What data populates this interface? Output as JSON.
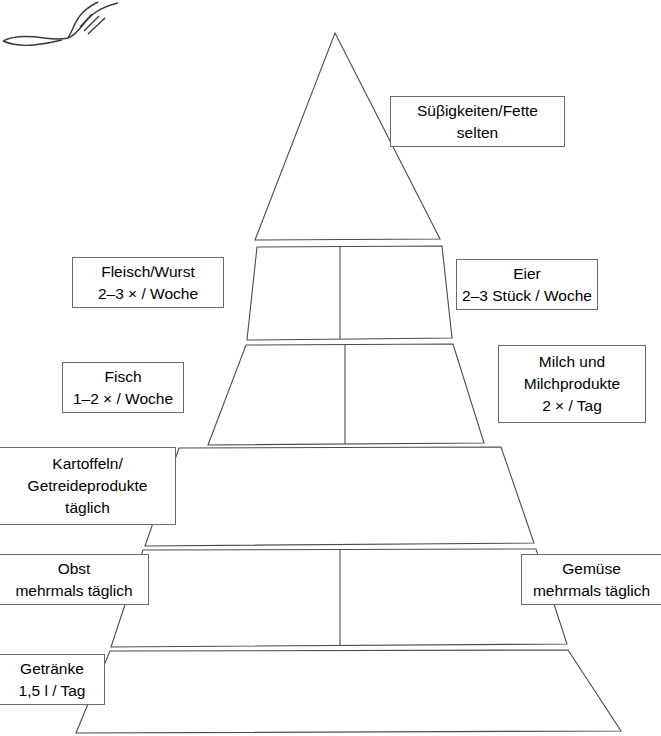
{
  "diagram": {
    "type": "food-pyramid",
    "tier_count": 6,
    "colors": {
      "stroke": "#4c4c4c",
      "box_border": "#6a6a6a",
      "fill": "#ffffff",
      "text": "#000000"
    }
  },
  "tiers": [
    {
      "index": 1,
      "name": "sweets-fats",
      "divided": false,
      "label_side": "right"
    },
    {
      "index": 2,
      "name": "meat-eggs",
      "divided": true,
      "label_side": "both"
    },
    {
      "index": 3,
      "name": "fish-dairy",
      "divided": true,
      "label_side": "both"
    },
    {
      "index": 4,
      "name": "potatoes-grains",
      "divided": false,
      "label_side": "left"
    },
    {
      "index": 5,
      "name": "fruit-vegetables",
      "divided": true,
      "label_side": "both"
    },
    {
      "index": 6,
      "name": "beverages",
      "divided": false,
      "label_side": "left"
    }
  ],
  "labels": {
    "sweets": {
      "title": "Süβigkeiten/Fette",
      "frequency": "selten"
    },
    "meat": {
      "title": "Fleisch/Wurst",
      "frequency": "2–3 × / Woche"
    },
    "eggs": {
      "title": "Eier",
      "frequency": "2–3 Stück / Woche"
    },
    "fish": {
      "title": "Fisch",
      "frequency": "1–2 × / Woche"
    },
    "dairy": {
      "title": "Milch und",
      "title2": "Milchprodukte",
      "frequency": "2 × / Tag"
    },
    "potatoes": {
      "title": "Kartoffeln/",
      "title2": "Getreideprodukte",
      "frequency": "täglich"
    },
    "fruit": {
      "title": "Obst",
      "frequency": "mehrmals täglich"
    },
    "vegetables": {
      "title": "Gemüse",
      "frequency": "mehrmals täglich"
    },
    "beverages": {
      "title": "Getränke",
      "frequency": "1,5 l / Tag"
    }
  }
}
